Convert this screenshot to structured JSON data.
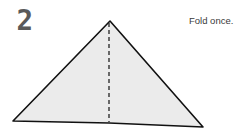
{
  "step": {
    "number": "2",
    "instruction": "Fold once."
  },
  "figure": {
    "shape": "triangle",
    "fill_color": "#ebebeb",
    "outline_color": "#111111",
    "fold_line": "dashed-vertical-center"
  }
}
